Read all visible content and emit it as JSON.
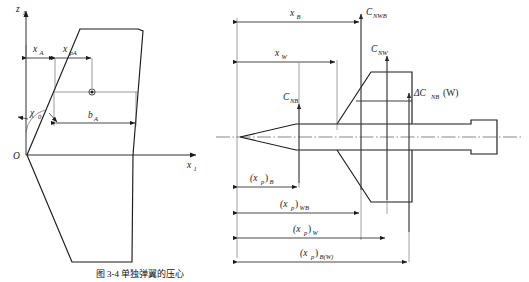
{
  "figure": {
    "caption": "图 3-4  单独弹翼的压心",
    "left_diagram": {
      "name": "wing-planform-pressure-center",
      "axes": {
        "vertical_label": "z",
        "vertical_sub": "1",
        "horizontal_label": "x",
        "horizontal_sub": "1",
        "origin_label": "O"
      },
      "annotations": [
        {
          "id": "sweep-angle",
          "label": "χ",
          "sub": "0"
        },
        {
          "id": "dim-xa",
          "label": "x",
          "sub": "A"
        },
        {
          "id": "dim-xpa",
          "label": "x",
          "sub": "pA"
        },
        {
          "id": "dim-ba",
          "label": "b",
          "sub": "A"
        },
        {
          "id": "pressure-center-marker",
          "label": ""
        }
      ]
    },
    "right_diagram": {
      "name": "wing-body-normal-force-and-pressure-centers",
      "force_labels": [
        {
          "id": "force-cnwb",
          "label": "C",
          "sub": "NWB"
        },
        {
          "id": "force-cnw",
          "label": "C",
          "sub": "NW"
        },
        {
          "id": "force-cnb",
          "label": "C",
          "sub": "NB"
        },
        {
          "id": "force-delta-cnbw",
          "prefix": "ΔC",
          "sub": "NB",
          "suffix": "(W)"
        }
      ],
      "top_dimensions": [
        {
          "id": "dim-xb",
          "label": "x",
          "sub": "B"
        },
        {
          "id": "dim-xw",
          "label": "x",
          "sub": "W"
        }
      ],
      "bottom_dimensions": [
        {
          "id": "dim-xp-b",
          "label": "(x",
          "sub": "p",
          "close": ")",
          "post": "B"
        },
        {
          "id": "dim-xp-wb",
          "label": "(x",
          "sub": "p",
          "close": ")",
          "post": "WB"
        },
        {
          "id": "dim-xp-w",
          "label": "(x",
          "sub": "p",
          "close": ")",
          "post": "W"
        },
        {
          "id": "dim-xp-bw",
          "label": "(x",
          "sub": "p",
          "close": ")",
          "post": "B(W)"
        }
      ]
    },
    "colors": {
      "line": "#1a1a1a",
      "thin": "#555555",
      "background": "#ffffff"
    }
  }
}
